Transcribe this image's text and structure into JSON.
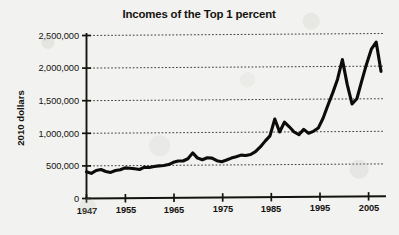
{
  "chart_data": {
    "type": "line",
    "title": "Incomes of the Top 1 percent",
    "xlabel": "",
    "ylabel": "2010 dollars",
    "xlim": [
      1947,
      2008
    ],
    "ylim": [
      0,
      2500000
    ],
    "grid": true,
    "legend": null,
    "x_ticks": [
      "1947",
      "1955",
      "1965",
      "1975",
      "1985",
      "1995",
      "2005"
    ],
    "x_tick_values": [
      1947,
      1955,
      1965,
      1975,
      1985,
      1995,
      2005
    ],
    "y_ticks": [
      "0",
      "500,000",
      "1,000,000",
      "1,500,000",
      "2,000,000",
      "2,500,000"
    ],
    "y_tick_values": [
      0,
      500000,
      1000000,
      1500000,
      2000000,
      2500000
    ],
    "series": [
      {
        "name": "Top 1 percent average income",
        "x": [
          1947,
          1948,
          1949,
          1950,
          1951,
          1952,
          1953,
          1954,
          1955,
          1956,
          1957,
          1958,
          1959,
          1960,
          1961,
          1962,
          1963,
          1964,
          1965,
          1966,
          1967,
          1968,
          1969,
          1970,
          1971,
          1972,
          1973,
          1974,
          1975,
          1976,
          1977,
          1978,
          1979,
          1980,
          1981,
          1982,
          1983,
          1984,
          1985,
          1986,
          1987,
          1988,
          1989,
          1990,
          1991,
          1992,
          1993,
          1994,
          1995,
          1996,
          1997,
          1998,
          1999,
          2000,
          2001,
          2002,
          2003,
          2004,
          2005,
          2006,
          2007,
          2008
        ],
        "values": [
          410000,
          385000,
          430000,
          445000,
          415000,
          400000,
          430000,
          440000,
          470000,
          465000,
          455000,
          445000,
          480000,
          475000,
          490000,
          500000,
          505000,
          520000,
          555000,
          575000,
          575000,
          610000,
          700000,
          620000,
          595000,
          625000,
          620000,
          580000,
          565000,
          590000,
          620000,
          640000,
          665000,
          660000,
          675000,
          720000,
          790000,
          880000,
          960000,
          1220000,
          1020000,
          1170000,
          1100000,
          1020000,
          980000,
          1060000,
          1000000,
          1030000,
          1080000,
          1230000,
          1430000,
          1620000,
          1830000,
          2130000,
          1750000,
          1450000,
          1530000,
          1800000,
          2060000,
          2290000,
          2400000,
          1950000
        ]
      }
    ]
  }
}
